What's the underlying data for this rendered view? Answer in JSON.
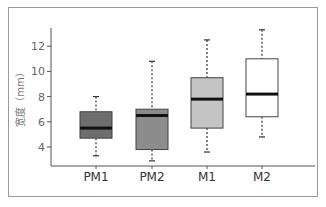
{
  "chart_data": {
    "type": "box",
    "title": "",
    "xlabel": "",
    "ylabel": "宽度（mm）",
    "categories": [
      "PM1",
      "PM2",
      "M1",
      "M2"
    ],
    "ylim": [
      2.5,
      13.5
    ],
    "yticks": [
      4,
      6,
      8,
      10,
      12
    ],
    "grid": false,
    "legend": null,
    "series": [
      {
        "name": "PM1",
        "whisker_low": 3.3,
        "q1": 4.7,
        "median": 5.5,
        "q3": 6.8,
        "whisker_high": 8.0,
        "fill": "#6e6e6e"
      },
      {
        "name": "PM2",
        "whisker_low": 2.9,
        "q1": 3.8,
        "median": 6.5,
        "q3": 7.0,
        "whisker_high": 10.8,
        "fill": "#8c8c8c"
      },
      {
        "name": "M1",
        "whisker_low": 3.6,
        "q1": 5.5,
        "median": 7.8,
        "q3": 9.5,
        "whisker_high": 12.5,
        "fill": "#c4c4c4"
      },
      {
        "name": "M2",
        "whisker_low": 4.8,
        "q1": 6.4,
        "median": 8.2,
        "q3": 11.0,
        "whisker_high": 13.3,
        "fill": "#ffffff"
      }
    ]
  }
}
